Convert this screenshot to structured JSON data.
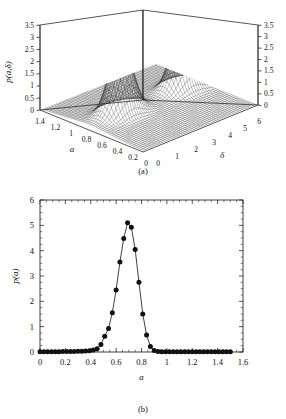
{
  "figure": {
    "panel_a": {
      "caption": "(a)",
      "zlabel": "p(a,δ)",
      "xlabel": "a",
      "ylabel": "δ",
      "z_ticks_left": [
        "3.5",
        "3",
        "2.5",
        "2",
        "1.5",
        "1",
        "0.5",
        "0"
      ],
      "z_ticks_right": [
        "3.5",
        "3",
        "2.5",
        "2",
        "1.5",
        "1",
        "0.5",
        "0"
      ],
      "a_ticks": [
        "1.4",
        "1.2",
        "1",
        "0.8",
        "0.6",
        "0.4",
        "0.2",
        "0"
      ],
      "delta_ticks": [
        "0",
        "1",
        "2",
        "3",
        "4",
        "5",
        "6"
      ]
    },
    "panel_b": {
      "caption": "(b)",
      "xlabel": "a",
      "ylabel": "p(a)",
      "x_ticks": [
        "0",
        "0.2",
        "0.4",
        "0.6",
        "0.8",
        "1",
        "1.2",
        "1.4",
        "1.6"
      ],
      "y_ticks": [
        "0",
        "1",
        "2",
        "3",
        "4",
        "5",
        "6"
      ]
    }
  },
  "chart_data": [
    {
      "type": "surface",
      "title": "",
      "xlabel": "a",
      "ylabel": "δ",
      "zlabel": "p(a,δ)",
      "xlim": [
        0,
        1.4
      ],
      "ylim": [
        0,
        6
      ],
      "zlim": [
        0,
        3.5
      ],
      "grid": true,
      "legend": "none",
      "description": "Mesh surface with two sharp Gaussian-like ridges rising from a low plateau",
      "peaks": [
        {
          "a": 0.72,
          "delta": 1.6,
          "z": 3.0
        },
        {
          "a": 0.72,
          "delta": 4.8,
          "z": 2.6
        }
      ]
    },
    {
      "type": "line",
      "title": "",
      "xlabel": "a",
      "ylabel": "p(a)",
      "xlim": [
        0,
        1.6
      ],
      "ylim": [
        0,
        6
      ],
      "grid": false,
      "legend": "none",
      "markers": "filled-circle",
      "x": [
        0.0,
        0.03,
        0.06,
        0.09,
        0.12,
        0.15,
        0.18,
        0.21,
        0.24,
        0.27,
        0.3,
        0.33,
        0.36,
        0.39,
        0.42,
        0.45,
        0.48,
        0.51,
        0.54,
        0.57,
        0.6,
        0.63,
        0.66,
        0.69,
        0.72,
        0.75,
        0.78,
        0.81,
        0.84,
        0.87,
        0.9,
        0.93,
        0.96,
        0.99,
        1.02,
        1.05,
        1.08,
        1.11,
        1.14,
        1.17,
        1.2,
        1.23,
        1.26,
        1.29,
        1.32,
        1.35,
        1.38,
        1.41,
        1.44,
        1.47,
        1.5
      ],
      "y": [
        0.01,
        0.01,
        0.01,
        0.01,
        0.01,
        0.01,
        0.02,
        0.02,
        0.02,
        0.02,
        0.03,
        0.03,
        0.04,
        0.05,
        0.08,
        0.13,
        0.3,
        0.62,
        0.93,
        1.55,
        2.45,
        3.55,
        4.48,
        5.1,
        4.92,
        4.05,
        2.75,
        1.5,
        0.67,
        0.22,
        0.06,
        0.02,
        0.01,
        0.01,
        0.01,
        0.01,
        0.01,
        0.01,
        0.01,
        0.01,
        0.01,
        0.01,
        0.01,
        0.01,
        0.01,
        0.01,
        0.01,
        0.01,
        0.01,
        0.01,
        0.01
      ],
      "peak": {
        "x": 0.69,
        "y": 5.1
      }
    }
  ]
}
